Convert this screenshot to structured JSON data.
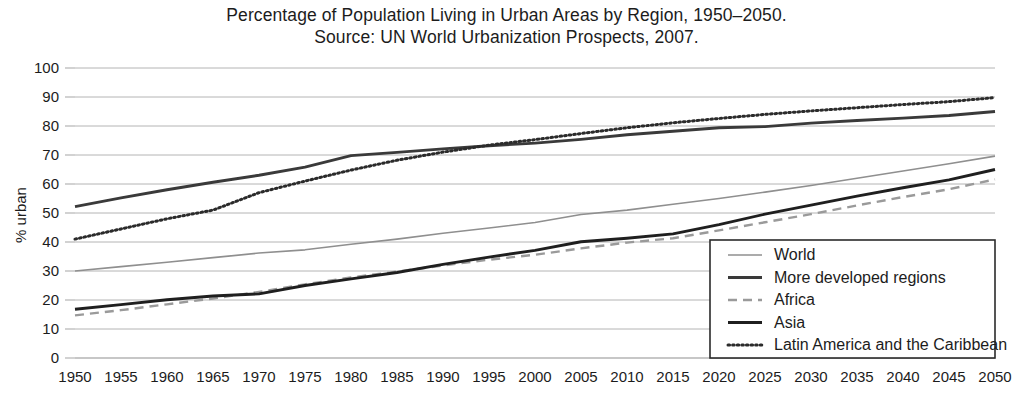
{
  "chart_data": {
    "type": "line",
    "title": "Percentage of Population Living in Urban Areas by Region, 1950–2050.",
    "subtitle": "Source: UN World Urbanization Prospects, 2007.",
    "xlabel": "",
    "ylabel": "% urban",
    "ylim": [
      0,
      100
    ],
    "ytick_step": 10,
    "grid": true,
    "legend_position": "bottom-right",
    "x": [
      1950,
      1955,
      1960,
      1965,
      1970,
      1975,
      1980,
      1985,
      1990,
      1995,
      2000,
      2005,
      2010,
      2015,
      2020,
      2025,
      2030,
      2035,
      2040,
      2045,
      2050
    ],
    "categories": [
      "1950",
      "1955",
      "1960",
      "1965",
      "1970",
      "1975",
      "1980",
      "1985",
      "1990",
      "1995",
      "2000",
      "2005",
      "2010",
      "2015",
      "2020",
      "2025",
      "2030",
      "2035",
      "2040",
      "2045",
      "2050"
    ],
    "yticks": [
      "0",
      "10",
      "20",
      "30",
      "40",
      "50",
      "60",
      "70",
      "80",
      "90",
      "100"
    ],
    "series": [
      {
        "name": "World",
        "style": "solid-thin-gray",
        "color": "#8f8f8f",
        "values": [
          30.0,
          31.5,
          33.0,
          34.6,
          36.2,
          37.3,
          39.2,
          41.0,
          43.0,
          44.8,
          46.7,
          49.5,
          51.0,
          53.0,
          55.0,
          57.2,
          59.5,
          62.0,
          64.5,
          67.0,
          69.6
        ]
      },
      {
        "name": "More developed regions",
        "style": "solid-thick-dark",
        "color": "#3a3a3a",
        "values": [
          52.2,
          55.2,
          58.0,
          60.6,
          63.0,
          65.8,
          69.8,
          70.9,
          72.1,
          73.2,
          74.1,
          75.4,
          77.0,
          78.2,
          79.4,
          79.8,
          81.0,
          81.9,
          82.7,
          83.6,
          85.0
        ]
      },
      {
        "name": "Africa",
        "style": "dashed-gray",
        "color": "#9a9a9a",
        "values": [
          14.7,
          16.5,
          18.5,
          20.5,
          22.8,
          25.4,
          27.8,
          29.8,
          31.9,
          33.9,
          35.6,
          37.8,
          39.8,
          41.3,
          44.0,
          46.8,
          49.6,
          52.6,
          55.5,
          58.2,
          61.6
        ]
      },
      {
        "name": "Asia",
        "style": "solid-thick-dark",
        "color": "#1f1f1f",
        "values": [
          16.8,
          18.4,
          20.1,
          21.4,
          22.1,
          25.0,
          27.3,
          29.5,
          32.3,
          34.8,
          37.1,
          40.1,
          41.3,
          42.8,
          46.0,
          49.6,
          52.7,
          55.8,
          58.7,
          61.4,
          65.0
        ]
      },
      {
        "name": "Latin America and the Caribbean",
        "style": "dotted-dark",
        "color": "#2b2b2b",
        "values": [
          41.0,
          44.5,
          48.0,
          51.0,
          57.0,
          61.0,
          64.8,
          68.2,
          71.0,
          73.4,
          75.3,
          77.4,
          79.4,
          81.1,
          82.6,
          84.0,
          85.2,
          86.3,
          87.4,
          88.4,
          89.8
        ]
      }
    ]
  },
  "legend": {
    "items": [
      {
        "label": "World"
      },
      {
        "label": "More developed regions"
      },
      {
        "label": "Africa"
      },
      {
        "label": "Asia"
      },
      {
        "label": "Latin America and the Caribbean"
      }
    ]
  },
  "colors": {
    "gridline": "#b4b4b4",
    "axis": "#4a4a4a",
    "text": "#1c1c1c",
    "background": "#ffffff",
    "legend_border": "#2b2b2b"
  }
}
